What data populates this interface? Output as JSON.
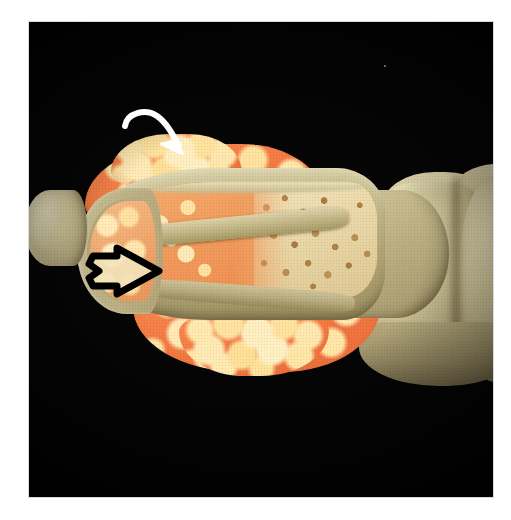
{
  "figure": {
    "domain": "medical-illustration",
    "plate_background": "#050505",
    "page_background": "#ffffff",
    "frame_color": "#d9dade",
    "plate_rect": {
      "x": 29,
      "y": 22,
      "width": 464,
      "height": 475
    },
    "caption": "",
    "view": "Sagittal cut-away of a metacarpophalangeal joint"
  },
  "palette": {
    "background_black": "#050505",
    "cortical_bone_tan": "#c9bf92",
    "cortical_bone_shadow": "#8e8360",
    "cortical_bone_highlight": "#e3dcb8",
    "pannus_orange": "#f47d45",
    "pannus_orange_deep": "#ea6c39",
    "pannus_nodule_cream": "#ffe9ae",
    "red_marrow": "#ef9f63",
    "trabecular_cream": "#e9d6a6",
    "trabecular_pore": "#ad8349",
    "white_arrow": "#ffffff",
    "black_arrow_outline": "#000000",
    "black_arrow_fill": "#f2e3bb"
  },
  "structures": [
    {
      "id": "left-bone-fragment",
      "label": "Adjacent bone fragment",
      "color": "#cfc59a"
    },
    {
      "id": "phalanx-head",
      "label": "Articular head of proximal phalanx",
      "color": "#c0b488"
    },
    {
      "id": "proximal-phalanx",
      "label": "Proximal phalanx (cut away)",
      "color": "#c9bf92"
    },
    {
      "id": "medullary-cavity",
      "label": "Medullary cavity",
      "color": "#e8d9ad"
    },
    {
      "id": "red-marrow",
      "label": "Red haematopoietic marrow",
      "color": "#ef9f63"
    },
    {
      "id": "trabecular-bone",
      "label": "Cancellous (trabecular) bone",
      "color": "#e9d6a6"
    },
    {
      "id": "pannus-dorsal",
      "label": "Dorsal pannus / hyperplastic synovium",
      "color": "#f47d45"
    },
    {
      "id": "pannus-volar",
      "label": "Volar pannus / hyperplastic synovium",
      "color": "#f47d45"
    },
    {
      "id": "metacarpal-head",
      "label": "Metacarpal head",
      "color": "#cfc599"
    },
    {
      "id": "distal-phalanx-base",
      "label": "Adjoining distal bone",
      "color": "#ccc196"
    }
  ],
  "annotations": [
    {
      "id": "white-arrow",
      "icon": "curved-arrow-icon",
      "label": "",
      "color": "#ffffff",
      "style": "curved hand-drawn arrow, solid white",
      "points_to": "pannus-dorsal",
      "direction": "down-right",
      "position": {
        "x": 92,
        "y": 82,
        "width": 86,
        "height": 62
      }
    },
    {
      "id": "black-arrow",
      "icon": "block-arrow-icon",
      "label": "",
      "color": "#000000",
      "style": "hollow block arrow, heavy black outline",
      "points_to": "marginal bone erosion at the joint margin",
      "direction": "right",
      "position": {
        "x": 58,
        "y": 222,
        "width": 76,
        "height": 56
      }
    }
  ],
  "artifacts": [
    {
      "id": "dust-speck",
      "label": "dust speck on plate",
      "x": 355,
      "y": 43,
      "size": 2
    }
  ]
}
